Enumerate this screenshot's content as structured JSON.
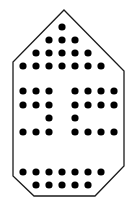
{
  "diagram": {
    "title": "",
    "background": "#ffffff",
    "outline": {
      "stroke": "#1a1a1a",
      "stroke_width": 1.3,
      "points": [
        [
          64,
          10
        ],
        [
          124,
          71
        ],
        [
          124,
          166
        ],
        [
          95,
          196
        ],
        [
          34,
          196
        ],
        [
          13,
          176
        ],
        [
          13,
          62
        ]
      ]
    },
    "dots": {
      "fill": "#000000",
      "radius": 3.6,
      "rows": [
        {
          "y": 27,
          "xs": [
            62
          ]
        },
        {
          "y": 40,
          "xs": [
            49,
            62,
            75
          ]
        },
        {
          "y": 53,
          "xs": [
            36,
            49,
            62,
            75,
            88
          ]
        },
        {
          "y": 66,
          "xs": [
            23,
            36,
            49,
            62,
            75,
            88,
            101
          ]
        },
        {
          "y": 91,
          "xs": [
            23,
            36,
            49,
            75,
            88,
            101,
            114
          ]
        },
        {
          "y": 105,
          "xs": [
            23,
            36,
            49,
            75,
            88,
            101,
            114
          ]
        },
        {
          "y": 118,
          "xs": [
            49,
            75
          ]
        },
        {
          "y": 132,
          "xs": [
            23,
            36,
            49,
            75,
            88,
            101,
            114
          ]
        },
        {
          "y": 172,
          "xs": [
            23,
            36,
            49,
            62,
            75,
            88,
            101
          ]
        },
        {
          "y": 185,
          "xs": [
            36,
            49,
            62,
            75,
            88
          ]
        }
      ]
    }
  }
}
